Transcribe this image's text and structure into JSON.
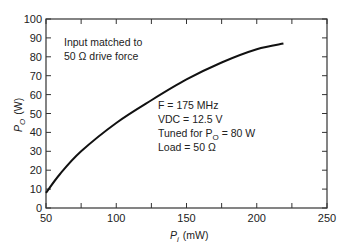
{
  "chart_data": {
    "type": "line",
    "title": "",
    "xlabel": "P_i (mW)",
    "ylabel": "P_O (W)",
    "xlim": [
      50,
      250
    ],
    "ylim": [
      0,
      100
    ],
    "x_ticks": [
      "50",
      "100",
      "150",
      "200",
      "250"
    ],
    "y_ticks": [
      "0",
      "10",
      "20",
      "30",
      "40",
      "50",
      "60",
      "70",
      "80",
      "90",
      "100"
    ],
    "grid": false,
    "series": [
      {
        "name": "P_O vs P_i",
        "x": [
          50,
          60,
          75,
          100,
          125,
          150,
          175,
          200,
          219
        ],
        "y": [
          8,
          18,
          30,
          45,
          57,
          68,
          77,
          84,
          87
        ]
      }
    ],
    "annotations": [
      "Input matched to",
      "50 Ω drive force",
      "F = 175 MHz",
      "VDC = 12.5 V",
      "Tuned for P_O = 80 W",
      "Load = 50 Ω"
    ]
  },
  "labels": {
    "xlabel_main": "P",
    "xlabel_sub": "i",
    "xlabel_unit": "(mW)",
    "ylabel_main": "P",
    "ylabel_sub": "O",
    "ylabel_unit": "(W)",
    "note1": "Input matched to",
    "note2": "50 Ω drive force",
    "cond1": "F = 175 MHz",
    "cond2": "VDC = 12.5 V",
    "cond3a": "Tuned for P",
    "cond3b": "O",
    "cond3c": " = 80 W",
    "cond4": "Load = 50 Ω"
  }
}
